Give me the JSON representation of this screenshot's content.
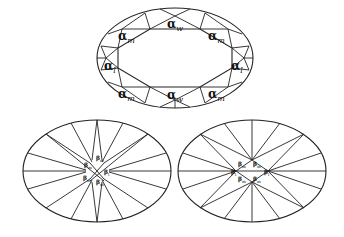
{
  "figure": {
    "top_panel": {
      "description": "Ellipse with inscribed octagonal facet pattern",
      "labels": [
        {
          "id": "top-w",
          "greek": "α",
          "sub": "w",
          "x": 175,
          "y": 24
        },
        {
          "id": "upper-left-m",
          "greek": "α",
          "sub": "m",
          "x": 126,
          "y": 36
        },
        {
          "id": "upper-right-m",
          "greek": "α",
          "sub": "m",
          "x": 216,
          "y": 36
        },
        {
          "id": "left-l",
          "greek": "α",
          "sub": "l",
          "x": 106,
          "y": 66
        },
        {
          "id": "right-l",
          "greek": "α",
          "sub": "l",
          "x": 237,
          "y": 66
        },
        {
          "id": "lower-left-m",
          "greek": "α",
          "sub": "m",
          "x": 126,
          "y": 94
        },
        {
          "id": "lower-right-m",
          "greek": "α",
          "sub": "m",
          "x": 216,
          "y": 94
        },
        {
          "id": "bottom-w",
          "greek": "α",
          "sub": "w",
          "x": 175,
          "y": 107
        }
      ]
    },
    "bottom_left_panel": {
      "description": "Ellipse with star rays converging to central region",
      "labels": [
        {
          "greek": "β",
          "sub": "m",
          "x": 88,
          "y": 165
        },
        {
          "greek": "β",
          "sub": "m",
          "x": 100,
          "y": 161
        },
        {
          "greek": "β",
          "sub": "m",
          "x": 85,
          "y": 178
        },
        {
          "greek": "β",
          "sub": "m",
          "x": 100,
          "y": 181
        },
        {
          "greek": "β",
          "sub": "l",
          "x": 108,
          "y": 172
        }
      ]
    },
    "bottom_right_panel": {
      "description": "Ellipse with radial rays and central diamond",
      "labels": [
        {
          "greek": "β",
          "sub": "m",
          "x": 242,
          "y": 164
        },
        {
          "greek": "β",
          "sub": "m",
          "x": 257,
          "y": 164
        },
        {
          "greek": "β",
          "sub": "m",
          "x": 242,
          "y": 179
        },
        {
          "greek": "β",
          "sub": "m",
          "x": 257,
          "y": 179
        },
        {
          "greek": "β",
          "sub": "l",
          "x": 233,
          "y": 172
        },
        {
          "greek": "β",
          "sub": "l",
          "x": 266,
          "y": 172
        }
      ]
    }
  }
}
